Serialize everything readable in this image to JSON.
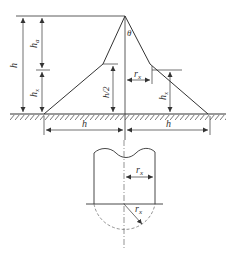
{
  "figure": {
    "type": "lightning protection zone diagram",
    "upper_view": {
      "labels": {
        "h_total": "h",
        "h_a": "h",
        "h_a_sub": "a",
        "h_x_left": "h",
        "h_x_left_sub": "x",
        "h_half": "h/2",
        "theta": "θ",
        "r_x": "r",
        "r_x_sub": "x",
        "h_x_right": "h",
        "h_x_right_sub": "x",
        "h_bottom_left": "h",
        "h_bottom_right": "h"
      }
    },
    "lower_view": {
      "labels": {
        "r_x_top": "r",
        "r_x_top_sub": "x",
        "r_x_radial": "r",
        "r_x_radial_sub": "x"
      }
    },
    "colors": {
      "line": "#333333",
      "ground_hatch": "#555555",
      "dashed": "#666666"
    }
  }
}
